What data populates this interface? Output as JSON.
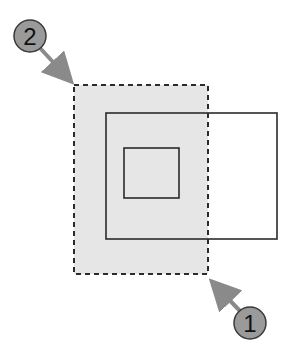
{
  "diagram": {
    "selection_rect": {
      "x": 74,
      "y": 85,
      "width": 134,
      "height": 189,
      "style": "dashed",
      "fill": "#e6e6e6"
    },
    "outer_rect": {
      "x": 106,
      "y": 113,
      "width": 171,
      "height": 126
    },
    "inner_rect": {
      "x": 124,
      "y": 148,
      "width": 55,
      "height": 50
    },
    "callouts": [
      {
        "label": "2",
        "cx": 30,
        "cy": 36,
        "r": 17,
        "arrow_to": [
          72,
          82
        ]
      },
      {
        "label": "1",
        "cx": 250,
        "cy": 323,
        "r": 16,
        "arrow_to": [
          211,
          280
        ]
      }
    ],
    "colors": {
      "line": "#2b2b2b",
      "selection_fill": "#e6e6e6",
      "callout_fill": "#9a9a9a",
      "arrow": "#8a8a8a"
    }
  }
}
